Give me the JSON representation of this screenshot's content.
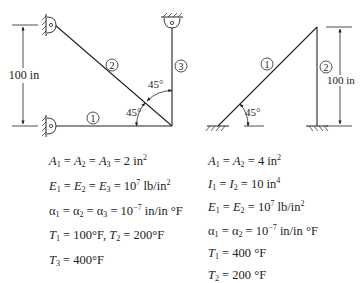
{
  "figure_left": {
    "members": [
      {
        "id": "member-1",
        "label": "1"
      },
      {
        "id": "member-2",
        "label": "2"
      },
      {
        "id": "member-3",
        "label": "3"
      }
    ],
    "dimension_label": "100 in",
    "angle_labels": [
      "45°",
      "45°"
    ],
    "supports": [
      "pin-top-left",
      "pin-bottom-left",
      "pin-top-right"
    ],
    "equations": [
      {
        "parts": [
          [
            "A",
            "1"
          ],
          " = ",
          [
            "A",
            "2"
          ],
          " = ",
          [
            "A",
            "3"
          ],
          " = 2 in",
          "2"
        ],
        "text": "A1 = A2 = A3 = 2 in²"
      },
      {
        "text": "E1 = E2 = E3 = 10⁷ lb/in²"
      },
      {
        "text": "α1 = α2 = α3 = 10⁻⁷ in/in °F"
      },
      {
        "text": "T1 = 100°F, T2 = 200°F"
      },
      {
        "text": "T3 = 400°F"
      }
    ]
  },
  "figure_right": {
    "members": [
      {
        "id": "member-1",
        "label": "1"
      },
      {
        "id": "member-2",
        "label": "2"
      }
    ],
    "dimension_label": "100 in",
    "angle_labels": [
      "45°"
    ],
    "supports": [
      "fixed-left",
      "fixed-right"
    ],
    "equations": [
      {
        "text": "A1 = A2 = 4 in²"
      },
      {
        "text": "I1 = I2 = 10 in⁴"
      },
      {
        "text": "E1 = E2 = 10⁷ lb/in²"
      },
      {
        "text": "α1 = α2 = 10⁻⁷ in/in °F"
      },
      {
        "text": "T1 = 400 °F"
      },
      {
        "text": "T2 = 200 °F"
      }
    ]
  },
  "text": {
    "L_dim": "100 in",
    "L_m1": "1",
    "L_m2": "2",
    "L_m3": "3",
    "L_ang1": "45°",
    "L_ang2": "45°",
    "R_dim": "100 in",
    "R_m1": "1",
    "R_m2": "2",
    "R_ang": "45°",
    "L_eq": {
      "A": [
        "A",
        "1",
        "=",
        "A",
        "2",
        "=",
        "A",
        "3",
        "= 2 in",
        "2"
      ],
      "E": [
        "E",
        "1",
        "=",
        "E",
        "2",
        "=",
        "E",
        "3",
        "= 10",
        "7",
        " lb/in",
        "2"
      ],
      "alpha": [
        "α",
        "1",
        "=",
        "α",
        "2",
        "=",
        "α",
        "3",
        "= 10",
        "−7",
        " in/in °F"
      ],
      "T12": [
        "T",
        "1",
        "= 100°F, ",
        "T",
        "2",
        "= 200°F"
      ],
      "T3": [
        "T",
        "3",
        "= 400°F"
      ]
    },
    "R_eq": {
      "A": [
        "A",
        "1",
        "=",
        "A",
        "2",
        "= 4 in",
        "2"
      ],
      "I": [
        "I",
        "1",
        "=",
        "I",
        "2",
        "= 10 in",
        "4"
      ],
      "E": [
        "E",
        "1",
        "=",
        "E",
        "2",
        "= 10",
        "7",
        " lb/in",
        "2"
      ],
      "alpha": [
        "α",
        "1",
        "=",
        "α",
        "2",
        "= 10",
        "−7",
        " in/in °F"
      ],
      "T1": [
        "T",
        "1",
        "= 400 °F"
      ],
      "T2": [
        "T",
        "2",
        "= 200 °F"
      ]
    }
  }
}
